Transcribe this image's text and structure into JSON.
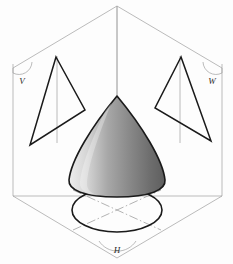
{
  "figure": {
    "background_color": "#fdfdfd",
    "frame_color": "#9a9a9a",
    "outline_color": "#1a1a1a",
    "centerline_color": "#9a9a9a"
  },
  "planes": [
    {
      "id": "V",
      "label": "V",
      "name": "vertical-frontal-plane",
      "label_x": 22,
      "label_y": 81
    },
    {
      "id": "W",
      "label": "W",
      "name": "profile-plane",
      "label_x": 211,
      "label_y": 81
    },
    {
      "id": "H",
      "label": "H",
      "name": "horizontal-plane",
      "label_x": 117,
      "label_y": 250
    }
  ],
  "solid": {
    "name": "cone",
    "fill_light": "#f2f2f2",
    "fill_mid": "#9d9d9d",
    "fill_dark": "#5c5c5c",
    "stroke": "#1a1a1a",
    "apex_x": 117,
    "apex_y": 96,
    "base_y": 186,
    "base_half_width": 48
  },
  "projections": [
    {
      "name": "front-view-triangle",
      "plane": "V",
      "shape": "triangle",
      "points": "56,58 84,110 30,145",
      "axis": "57,57 57,141"
    },
    {
      "name": "side-view-triangle",
      "plane": "W",
      "shape": "triangle",
      "points": "182,58 156,108 212,141"
    },
    {
      "name": "top-view-circle",
      "plane": "H",
      "shape": "ellipse",
      "cx": 117,
      "cy": 210,
      "rx": 45,
      "ry": 22
    }
  ],
  "centerlines": [
    {
      "name": "vertical-axis-line",
      "x1": 117,
      "y1": 6,
      "x2": 117,
      "y2": 96
    },
    {
      "name": "cone-axis-to-base",
      "x1": 117,
      "y1": 96,
      "x2": 117,
      "y2": 210
    },
    {
      "name": "top-view-diagonal-a",
      "x1": 77,
      "y1": 192,
      "x2": 158,
      "y2": 228
    },
    {
      "name": "top-view-diagonal-b",
      "x1": 77,
      "y1": 228,
      "x2": 158,
      "y2": 192
    }
  ],
  "box": {
    "name": "projection-box",
    "apex_top": {
      "x": 117,
      "y": 6
    },
    "left_top": {
      "x": 13,
      "y": 68
    },
    "right_top": {
      "x": 222,
      "y": 68
    },
    "center": {
      "x": 117,
      "y": 196
    },
    "left_bottom": {
      "x": 13,
      "y": 196
    },
    "right_bottom": {
      "x": 222,
      "y": 196
    },
    "apex_bottom": {
      "x": 117,
      "y": 258
    }
  }
}
